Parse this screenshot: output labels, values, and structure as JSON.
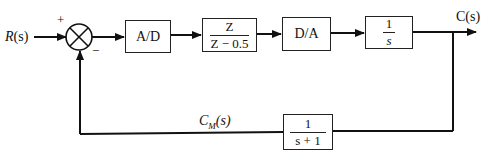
{
  "diagram": {
    "type": "feedback-control-block-diagram",
    "input_label": "R(s)",
    "output_label": "C(s)",
    "feedback_signal_label": "C_M(s)",
    "summing_junction": {
      "plus_sign": "+",
      "minus_sign": "−"
    },
    "forward_blocks": [
      {
        "id": "ad",
        "label": "A/D"
      },
      {
        "id": "digital-controller",
        "numerator": "Z",
        "denominator": "Z − 0.5"
      },
      {
        "id": "da",
        "label": "D/A"
      },
      {
        "id": "plant",
        "numerator": "1",
        "denominator": "s"
      }
    ],
    "feedback_block": {
      "numerator": "1",
      "denominator": "s + 1"
    }
  },
  "labels": {
    "R": "R",
    "R_arg": "(s)",
    "C": "C(s)",
    "CM_main": "C",
    "CM_sub": "M",
    "CM_arg": "(s)"
  }
}
